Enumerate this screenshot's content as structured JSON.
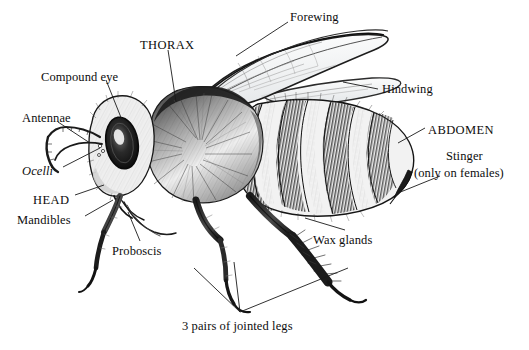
{
  "figure": {
    "style": "pen and ink stipple illustration, lateral view",
    "background_color": "#ffffff",
    "ink_color": "#111111",
    "width": 529,
    "height": 350
  },
  "labels": [
    {
      "id": "forewing",
      "text": "Forewing",
      "x": 290,
      "y": 10,
      "style": "plain"
    },
    {
      "id": "thorax",
      "text": "THORAX",
      "x": 140,
      "y": 38,
      "style": "caps"
    },
    {
      "id": "hindwing",
      "text": "Hindwing",
      "x": 382,
      "y": 82,
      "style": "plain"
    },
    {
      "id": "compound_eye",
      "text": "Compound eye",
      "x": 41,
      "y": 70,
      "style": "plain"
    },
    {
      "id": "antennae",
      "text": "Antennae",
      "x": 22,
      "y": 111,
      "style": "plain"
    },
    {
      "id": "abdomen",
      "text": "ABDOMEN",
      "x": 428,
      "y": 123,
      "style": "caps"
    },
    {
      "id": "ocelli",
      "text": "Ocelli",
      "x": 22,
      "y": 164,
      "style": "italic"
    },
    {
      "id": "stinger",
      "text": "Stinger",
      "x": 446,
      "y": 149,
      "style": "plain"
    },
    {
      "id": "stinger_note",
      "text": "(only on females)",
      "x": 414,
      "y": 166,
      "style": "plain"
    },
    {
      "id": "head",
      "text": "HEAD",
      "x": 33,
      "y": 193,
      "style": "caps"
    },
    {
      "id": "mandibles",
      "text": "Mandibles",
      "x": 17,
      "y": 213,
      "style": "plain"
    },
    {
      "id": "wax_glands",
      "text": "Wax glands",
      "x": 313,
      "y": 233,
      "style": "plain"
    },
    {
      "id": "proboscis",
      "text": "Proboscis",
      "x": 112,
      "y": 244,
      "style": "plain"
    },
    {
      "id": "jointed_legs",
      "text": "3 pairs of jointed legs",
      "x": 182,
      "y": 319,
      "style": "plain"
    }
  ],
  "leader_lines": [
    {
      "id": "forewing-leader",
      "from": [
        288,
        22
      ],
      "to": [
        236,
        56
      ]
    },
    {
      "id": "thorax-leader",
      "from": [
        168,
        50
      ],
      "to": [
        176,
        102
      ]
    },
    {
      "id": "hindwing-leader",
      "from": [
        378,
        89
      ],
      "to": [
        343,
        82
      ]
    },
    {
      "id": "compound-eye-leader",
      "from": [
        106,
        80
      ],
      "to": [
        122,
        120
      ]
    },
    {
      "id": "antennae-leader",
      "from": [
        58,
        122
      ],
      "to": [
        90,
        143
      ]
    },
    {
      "id": "abdomen-leader",
      "from": [
        425,
        128
      ],
      "to": [
        398,
        143
      ]
    },
    {
      "id": "ocelli-leader",
      "from": [
        63,
        167
      ],
      "to": [
        100,
        148
      ]
    },
    {
      "id": "stinger-leader",
      "from": [
        440,
        176
      ],
      "to": [
        398,
        193
      ]
    },
    {
      "id": "head-leader",
      "from": [
        75,
        195
      ],
      "to": [
        104,
        185
      ]
    },
    {
      "id": "mandibles-leader",
      "from": [
        85,
        216
      ],
      "to": [
        113,
        200
      ]
    },
    {
      "id": "waxglands-leader",
      "from": [
        345,
        230
      ],
      "to": [
        305,
        218
      ]
    },
    {
      "id": "proboscis-leader",
      "from": [
        140,
        241
      ],
      "to": [
        128,
        212
      ]
    },
    {
      "id": "legs-leader-1",
      "from": [
        240,
        312
      ],
      "to": [
        194,
        268
      ]
    },
    {
      "id": "legs-leader-2",
      "from": [
        240,
        312
      ],
      "to": [
        234,
        262
      ]
    },
    {
      "id": "legs-leader-3",
      "from": [
        240,
        312
      ],
      "to": [
        348,
        268
      ]
    }
  ],
  "anatomy_parts": [
    "head",
    "compound eye",
    "ocelli",
    "antennae",
    "mandibles",
    "proboscis",
    "thorax",
    "forewing",
    "hindwing",
    "abdomen",
    "stinger",
    "wax glands",
    "3 pairs of jointed legs"
  ]
}
